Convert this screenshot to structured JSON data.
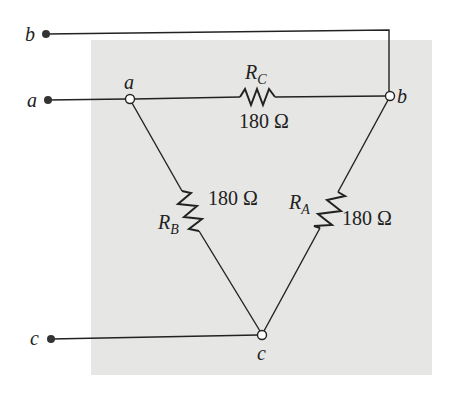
{
  "diagram": {
    "type": "delta-network",
    "background_color": "#e6e6e4",
    "line_color": "#222222",
    "external_terminals": [
      {
        "id": "b",
        "label": "b",
        "x": 46,
        "y": 34
      },
      {
        "id": "a",
        "label": "a",
        "x": 48,
        "y": 100
      },
      {
        "id": "c",
        "label": "c",
        "x": 51,
        "y": 339
      }
    ],
    "nodes": [
      {
        "id": "a",
        "label": "a",
        "x": 130,
        "y": 99
      },
      {
        "id": "b",
        "label": "b",
        "x": 390,
        "y": 96
      },
      {
        "id": "c",
        "label": "c",
        "x": 262,
        "y": 335
      }
    ],
    "resistors": [
      {
        "id": "RC",
        "name": "R",
        "subscript": "C",
        "value": "180 Ω",
        "between": [
          "a",
          "b"
        ]
      },
      {
        "id": "RB",
        "name": "R",
        "subscript": "B",
        "value": "180 Ω",
        "between": [
          "a",
          "c"
        ]
      },
      {
        "id": "RA",
        "name": "R",
        "subscript": "A",
        "value": "180 Ω",
        "between": [
          "b",
          "c"
        ]
      }
    ]
  }
}
